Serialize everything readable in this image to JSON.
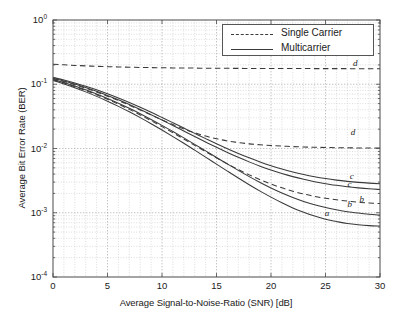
{
  "chart_data": {
    "type": "line",
    "title": "",
    "xlabel": "Average Signal-to-Noise-Ratio (SNR) [dB]",
    "ylabel": "Average Bit Error Rate (BER)",
    "xlim": [
      0,
      30
    ],
    "ylim": [
      0.0001,
      1
    ],
    "yscale": "log",
    "xscale": "linear",
    "grid": true,
    "xticks": [
      "0",
      "5",
      "10",
      "15",
      "20",
      "25",
      "30"
    ],
    "xtick_values": [
      0,
      5,
      10,
      15,
      20,
      25,
      30
    ],
    "yticks": [
      "10-4",
      "10-3",
      "10-2",
      "10-1",
      "100"
    ],
    "ytick_values": [
      0.0001,
      0.001,
      0.01,
      0.1,
      1
    ],
    "ytick_mantissa": [
      "10",
      "10",
      "10",
      "10",
      "10"
    ],
    "ytick_exponent": [
      "-4",
      "-3",
      "-2",
      "-1",
      "0"
    ],
    "legend": {
      "position": "top-right",
      "entries": [
        {
          "name": "Single Carrier",
          "style": "dashed"
        },
        {
          "name": "Multicarrier",
          "style": "solid"
        }
      ]
    },
    "annotations": [
      {
        "text": "d",
        "x": 27.8,
        "y": 0.175,
        "series": "sc-d"
      },
      {
        "text": "d",
        "x": 27.6,
        "y": 0.0145,
        "series": "sc-c"
      },
      {
        "text": "c",
        "x": 27.5,
        "y": 0.00305,
        "series": "mc-c1"
      },
      {
        "text": "c",
        "x": 27.3,
        "y": 0.00222,
        "series": "mc-c2"
      },
      {
        "text": "b",
        "x": 28.4,
        "y": 0.00133,
        "series": "sc-b"
      },
      {
        "text": "b",
        "x": 27.3,
        "y": 0.001085,
        "series": "mc-b"
      },
      {
        "text": "a",
        "x": 25.2,
        "y": 0.00079,
        "series": "mc-a"
      }
    ],
    "x": [
      0,
      1,
      2,
      3,
      4,
      5,
      6,
      7,
      8,
      9,
      10,
      11,
      12,
      13,
      14,
      15,
      16,
      17,
      18,
      19,
      20,
      21,
      22,
      23,
      24,
      25,
      26,
      27,
      28,
      29,
      30
    ],
    "series": [
      {
        "name": "sc-d",
        "label": "d",
        "style": "dashed",
        "group": "Single Carrier",
        "values": [
          0.205,
          0.2005,
          0.1965,
          0.193,
          0.1902,
          0.1878,
          0.1858,
          0.1841,
          0.1827,
          0.1815,
          0.1805,
          0.1796,
          0.1789,
          0.1783,
          0.1778,
          0.1773,
          0.1769,
          0.1766,
          0.1763,
          0.176,
          0.1758,
          0.1756,
          0.1754,
          0.1753,
          0.1752,
          0.1751,
          0.175,
          0.1749,
          0.1748,
          0.1747,
          0.1747
        ]
      },
      {
        "name": "sc-c",
        "label": "d",
        "style": "dashed",
        "group": "Single Carrier",
        "values": [
          0.123,
          0.1105,
          0.0985,
          0.0868,
          0.0757,
          0.0653,
          0.0558,
          0.0472,
          0.0397,
          0.0333,
          0.0279,
          0.0236,
          0.0202,
          0.0176,
          0.0156,
          0.0142,
          0.0131,
          0.0124,
          0.0118,
          0.0114,
          0.0111,
          0.0109,
          0.0107,
          0.01055,
          0.01045,
          0.01037,
          0.0103,
          0.01025,
          0.01021,
          0.01018,
          0.01015
        ]
      },
      {
        "name": "sc-b",
        "label": "b",
        "style": "dashed",
        "group": "Single Carrier",
        "values": [
          0.118,
          0.1045,
          0.0918,
          0.0798,
          0.0686,
          0.0583,
          0.0489,
          0.0406,
          0.0333,
          0.0271,
          0.0219,
          0.01755,
          0.01402,
          0.01118,
          0.00893,
          0.00715,
          0.00577,
          0.00471,
          0.00389,
          0.00327,
          0.0028,
          0.00244,
          0.00217,
          0.00196,
          0.0018,
          0.00168,
          0.00159,
          0.00152,
          0.00146,
          0.00142,
          0.00139
        ]
      },
      {
        "name": "mc-c1",
        "label": "c",
        "style": "solid",
        "group": "Multicarrier",
        "values": [
          0.128,
          0.1165,
          0.1048,
          0.0932,
          0.0819,
          0.0711,
          0.0611,
          0.0519,
          0.0437,
          0.0366,
          0.0304,
          0.0252,
          0.0208,
          0.0172,
          0.01425,
          0.01185,
          0.00992,
          0.00838,
          0.00715,
          0.00617,
          0.0054,
          0.00479,
          0.00431,
          0.00393,
          0.00363,
          0.0034,
          0.00322,
          0.00308,
          0.00297,
          0.00289,
          0.00283
        ]
      },
      {
        "name": "mc-c2",
        "label": "c",
        "style": "solid",
        "group": "Multicarrier",
        "values": [
          0.1245,
          0.1125,
          0.1005,
          0.0888,
          0.0776,
          0.067,
          0.0572,
          0.0483,
          0.0404,
          0.0336,
          0.0277,
          0.0228,
          0.0187,
          0.01533,
          0.01262,
          0.01043,
          0.00868,
          0.00729,
          0.00619,
          0.00531,
          0.00462,
          0.00408,
          0.00365,
          0.00331,
          0.00304,
          0.00283,
          0.00267,
          0.00254,
          0.00244,
          0.00236,
          0.0023
        ]
      },
      {
        "name": "mc-b",
        "label": "b",
        "style": "solid",
        "group": "Multicarrier",
        "values": [
          0.1195,
          0.1065,
          0.0938,
          0.0818,
          0.0705,
          0.0601,
          0.0506,
          0.0422,
          0.0347,
          0.0283,
          0.0229,
          0.01835,
          0.01463,
          0.01161,
          0.00918,
          0.00725,
          0.00574,
          0.00456,
          0.00365,
          0.00296,
          0.00243,
          0.00203,
          0.00173,
          0.0015,
          0.00133,
          0.00121,
          0.00111,
          0.00104,
          0.00099,
          0.00095,
          0.00092
        ]
      },
      {
        "name": "mc-a",
        "label": "a",
        "style": "solid",
        "group": "Multicarrier",
        "values": [
          0.1145,
          0.1012,
          0.0883,
          0.0761,
          0.0648,
          0.0545,
          0.0453,
          0.0372,
          0.0302,
          0.0243,
          0.01938,
          0.01533,
          0.01205,
          0.00942,
          0.00734,
          0.00571,
          0.00444,
          0.00347,
          0.00273,
          0.00217,
          0.00175,
          0.00143,
          0.00119,
          0.00102,
          0.00089,
          0.00079,
          0.00073,
          0.00068,
          0.00065,
          0.00063,
          0.00062
        ]
      }
    ]
  },
  "plot": {
    "stroke_color": "#3a3a3a",
    "grid_color": "#b8b8b8",
    "axis_color": "#4a4a4a",
    "background": "#ffffff"
  }
}
